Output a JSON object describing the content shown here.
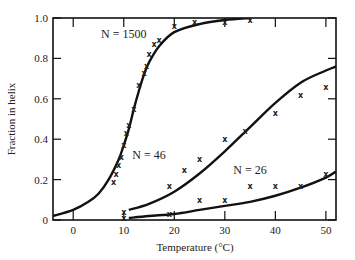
{
  "chart_data": {
    "type": "line",
    "title": "",
    "xlabel": "Temperature (°C)",
    "ylabel": "Fraction in helix",
    "xlim": [
      -4,
      52
    ],
    "ylim": [
      0,
      1.0
    ],
    "x_ticks": [
      0,
      10,
      20,
      30,
      40,
      50
    ],
    "y_ticks": [
      0,
      0.2,
      0.4,
      0.6,
      0.8,
      1.0
    ],
    "y_tick_labels": [
      "0",
      "0.2",
      "0.4",
      "0.6",
      "0.8",
      "1.0"
    ],
    "grid": false,
    "legend": "none (inline curve labels)",
    "series": [
      {
        "name": "N = 1500",
        "label_pos": {
          "x": 10,
          "y": 0.9
        },
        "curve": {
          "x": [
            -4,
            0,
            3,
            5,
            7,
            9,
            10,
            11,
            12,
            13,
            14,
            15,
            17,
            20,
            25,
            30,
            35
          ],
          "y": [
            0.02,
            0.05,
            0.09,
            0.13,
            0.2,
            0.3,
            0.37,
            0.45,
            0.55,
            0.64,
            0.72,
            0.78,
            0.86,
            0.93,
            0.97,
            0.99,
            1.0
          ]
        },
        "points": {
          "x": [
            8,
            8.5,
            9,
            9.5,
            10,
            10.5,
            11,
            12,
            13,
            14,
            14.5,
            15,
            16,
            17,
            20,
            24,
            30,
            35
          ],
          "y": [
            0.19,
            0.23,
            0.27,
            0.31,
            0.37,
            0.43,
            0.47,
            0.55,
            0.67,
            0.73,
            0.76,
            0.82,
            0.87,
            0.89,
            0.96,
            0.98,
            0.98,
            0.99
          ]
        }
      },
      {
        "name": "N = 46",
        "label_pos": {
          "x": 15,
          "y": 0.3
        },
        "curve": {
          "x": [
            11,
            15,
            20,
            25,
            30,
            35,
            40,
            45,
            50,
            52
          ],
          "y": [
            0.05,
            0.08,
            0.14,
            0.23,
            0.34,
            0.46,
            0.58,
            0.68,
            0.74,
            0.76
          ]
        },
        "points": {
          "x": [
            10,
            19,
            22,
            25,
            30,
            34,
            40,
            45,
            50
          ],
          "y": [
            0.04,
            0.17,
            0.25,
            0.3,
            0.4,
            0.44,
            0.53,
            0.62,
            0.66
          ]
        }
      },
      {
        "name": "N = 26",
        "label_pos": {
          "x": 35,
          "y": 0.23
        },
        "curve": {
          "x": [
            11,
            15,
            20,
            25,
            30,
            35,
            40,
            45,
            50,
            52
          ],
          "y": [
            0.01,
            0.02,
            0.03,
            0.05,
            0.07,
            0.09,
            0.12,
            0.16,
            0.21,
            0.24
          ]
        },
        "points": {
          "x": [
            10,
            19,
            25,
            30,
            35,
            40,
            45,
            50
          ],
          "y": [
            0.01,
            0.03,
            0.1,
            0.1,
            0.17,
            0.17,
            0.17,
            0.23
          ]
        }
      }
    ],
    "point_marker": "x"
  }
}
